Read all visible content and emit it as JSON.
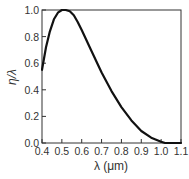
{
  "chart_data": {
    "type": "line",
    "title": "",
    "xlabel": "λ (μm)",
    "ylabel": "η/λ",
    "xlim": [
      0.4,
      1.1
    ],
    "ylim": [
      0.0,
      1.0
    ],
    "grid": false,
    "legend": null,
    "x_ticks": [
      "0.4",
      "0.5",
      "0.6",
      "0.7",
      "0.8",
      "0.9",
      "1.0",
      "1.1"
    ],
    "y_ticks": [
      "0.0",
      "0.2",
      "0.4",
      "0.6",
      "0.8",
      "1.0"
    ],
    "series": [
      {
        "name": "η/λ",
        "color": "#111111",
        "x": [
          0.4,
          0.42,
          0.44,
          0.46,
          0.48,
          0.5,
          0.52,
          0.54,
          0.56,
          0.58,
          0.6,
          0.65,
          0.7,
          0.75,
          0.8,
          0.85,
          0.9,
          0.95,
          1.0,
          1.02,
          1.05,
          1.1
        ],
        "y": [
          0.55,
          0.72,
          0.84,
          0.93,
          0.98,
          1.0,
          1.0,
          0.99,
          0.96,
          0.91,
          0.85,
          0.69,
          0.53,
          0.39,
          0.27,
          0.17,
          0.09,
          0.04,
          0.01,
          0.0,
          0.0,
          0.0
        ]
      }
    ]
  }
}
